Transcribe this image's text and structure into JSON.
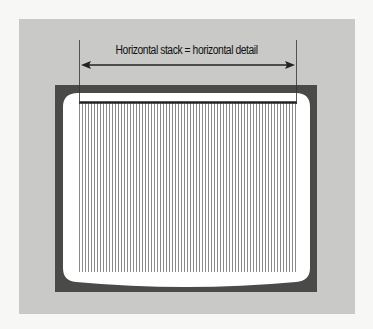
{
  "diagram": {
    "caption": "Horizontal stack = horizontal detail",
    "arrow": {
      "direction": "double-headed horizontal",
      "x_start": 80,
      "x_end": 296,
      "y": 65
    },
    "screen": {
      "description": "CRT television screen with vertical scan lines",
      "line_count": 73,
      "line_pitch_px": 3,
      "lines_x_start": 79,
      "lines_x_end": 296,
      "lines_y_start": 102,
      "lines_y_end": 272
    },
    "colors": {
      "page": "#f7f7f5",
      "panel": "#c9c9c7",
      "frame": "#4a4a48",
      "screen": "#ffffff",
      "scan_line": "#8a8a8a",
      "top_bar": "#222222",
      "arrow": "#222222"
    }
  }
}
